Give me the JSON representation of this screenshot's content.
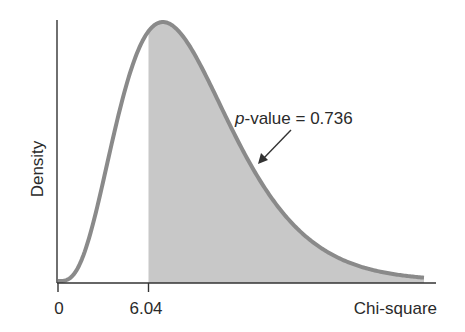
{
  "chart_data": {
    "type": "area",
    "title": "",
    "xlabel": "Chi-square",
    "ylabel": "Density",
    "x_ticks": [
      {
        "value": 0,
        "label": "0"
      },
      {
        "value": 6.04,
        "label": "6.04"
      }
    ],
    "distribution": "chi-square",
    "degrees_of_freedom": 9,
    "test_statistic": 6.04,
    "shaded_region": {
      "from": 6.04,
      "to": "upper tail"
    },
    "annotation": {
      "prefix": "p",
      "text": "-value = 0.736",
      "value": 0.736
    },
    "xlim": [
      0,
      26
    ],
    "grid": false,
    "legend": false,
    "colors": {
      "curve": "#8a8a8a",
      "fill": "#c8c8c8",
      "axis": "#333333",
      "text": "#2a2a2a"
    }
  }
}
